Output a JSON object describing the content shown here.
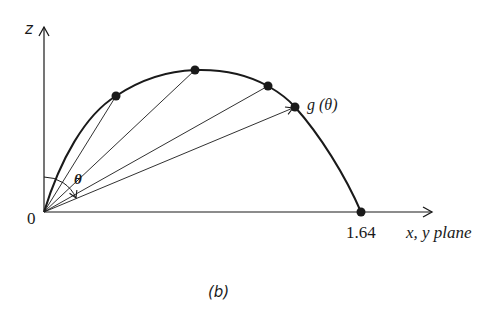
{
  "figure": {
    "caption": "(b)",
    "axes": {
      "z_label": "z",
      "x_label": "x, y plane",
      "origin_label": "0",
      "x_tick_label": "1.64"
    },
    "angle_label": "θ",
    "curve_point_label": "g (θ)",
    "colors": {
      "ink": "#1a1a1a",
      "background": "#ffffff"
    }
  }
}
